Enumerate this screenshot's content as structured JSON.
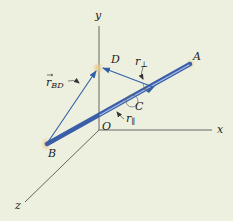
{
  "diagram": {
    "background": "#eef0df",
    "axes": {
      "origin_label": "O",
      "x_label": "x",
      "y_label": "y",
      "z_label": "z",
      "color": "#555555"
    },
    "points": {
      "A": "A",
      "B": "B",
      "C": "C",
      "D": "D"
    },
    "vectors": {
      "r_BD": {
        "base": "r",
        "sub": "BD"
      },
      "r_perp": {
        "base": "r",
        "sub": "⊥"
      },
      "r_parallel": {
        "base": "r",
        "sub": "∥"
      }
    },
    "colors": {
      "rod": "#3a5ea8",
      "rod_highlight": "#a9bde6",
      "vector": "#2f5fa8",
      "support": "#d9b77a"
    }
  }
}
